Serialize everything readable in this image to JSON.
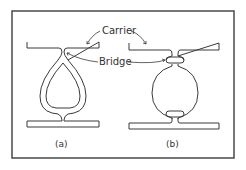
{
  "figure": {
    "labels": {
      "carrier": "Carrier",
      "bridge": "Bridge"
    },
    "captions": {
      "a": "(a)",
      "b": "(b)"
    }
  },
  "colors": {
    "stroke": "#3a3a3a",
    "frame": "#4a4a4a",
    "background": "#ffffff"
  }
}
